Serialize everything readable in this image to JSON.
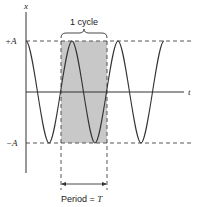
{
  "diagram": {
    "axes": {
      "y_label": "x",
      "x_label": "t"
    },
    "levels": {
      "plus_amplitude": "+A",
      "minus_amplitude": "−A"
    },
    "annotations": {
      "cycle_label": "1 cycle",
      "period_label": "Period = ",
      "period_symbol": "T"
    },
    "colors": {
      "curve": "#333333",
      "shade": "#c8c8c8",
      "dashed": "#444444",
      "axis": "#333333"
    }
  }
}
